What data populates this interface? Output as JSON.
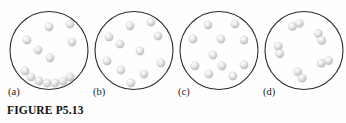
{
  "figure": {
    "caption": "FIGURE P5.13",
    "partial_top_text": "",
    "colors": {
      "background": "#fefefe",
      "circle_outline": "#2b2b2b",
      "sphere_fill": "#e9e9e9",
      "sphere_highlight": "#ffffff",
      "sphere_shadow": "#b5b5b5",
      "label_text": "#1a1a1a",
      "caption_text": "#111111"
    },
    "circle": {
      "cx": 41,
      "cy": 42.5,
      "r": 39,
      "stroke_width": 1.1
    },
    "sphere_radius": 4.2,
    "panels": [
      {
        "id": "a",
        "label": "(a)",
        "description": "gas particles with a cluster of condensed spheres settled along the bottom of the container",
        "particle_count": 13,
        "molecule_type": "monatomic",
        "spheres": [
          {
            "x": 41,
            "y": 19
          },
          {
            "x": 62,
            "y": 16
          },
          {
            "x": 19,
            "y": 32
          },
          {
            "x": 64,
            "y": 34
          },
          {
            "x": 30,
            "y": 42
          },
          {
            "x": 42,
            "y": 50
          },
          {
            "x": 23,
            "y": 69
          },
          {
            "x": 31,
            "y": 73
          },
          {
            "x": 39,
            "y": 75
          },
          {
            "x": 47,
            "y": 75
          },
          {
            "x": 55,
            "y": 73
          },
          {
            "x": 62,
            "y": 69
          },
          {
            "x": 17,
            "y": 63
          }
        ]
      },
      {
        "id": "b",
        "label": "(b)",
        "description": "gas particles dispersed evenly throughout the container",
        "particle_count": 11,
        "molecule_type": "monatomic",
        "spheres": [
          {
            "x": 37,
            "y": 18
          },
          {
            "x": 58,
            "y": 14
          },
          {
            "x": 16,
            "y": 29
          },
          {
            "x": 65,
            "y": 28
          },
          {
            "x": 27,
            "y": 36
          },
          {
            "x": 47,
            "y": 43
          },
          {
            "x": 14,
            "y": 53
          },
          {
            "x": 68,
            "y": 55
          },
          {
            "x": 28,
            "y": 62
          },
          {
            "x": 51,
            "y": 66
          },
          {
            "x": 38,
            "y": 75
          }
        ]
      },
      {
        "id": "c",
        "label": "(c)",
        "description": "gas particles dispersed evenly throughout the container",
        "particle_count": 11,
        "molecule_type": "monatomic",
        "spheres": [
          {
            "x": 30,
            "y": 17
          },
          {
            "x": 57,
            "y": 16
          },
          {
            "x": 15,
            "y": 31
          },
          {
            "x": 43,
            "y": 31
          },
          {
            "x": 66,
            "y": 32
          },
          {
            "x": 35,
            "y": 47
          },
          {
            "x": 17,
            "y": 58
          },
          {
            "x": 66,
            "y": 57
          },
          {
            "x": 31,
            "y": 66
          },
          {
            "x": 55,
            "y": 68
          },
          {
            "x": 44,
            "y": 58
          }
        ]
      },
      {
        "id": "d",
        "label": "(d)",
        "description": "diatomic molecules: bonded pairs of spheres dispersed in the container",
        "particle_count": 5,
        "molecule_type": "diatomic",
        "molecules": [
          {
            "x": 33,
            "y": 17,
            "angle": -25
          },
          {
            "x": 57,
            "y": 29,
            "angle": 62
          },
          {
            "x": 16,
            "y": 42,
            "angle": 78
          },
          {
            "x": 62,
            "y": 54,
            "angle": -20
          },
          {
            "x": 37,
            "y": 67,
            "angle": 55
          }
        ]
      }
    ]
  }
}
